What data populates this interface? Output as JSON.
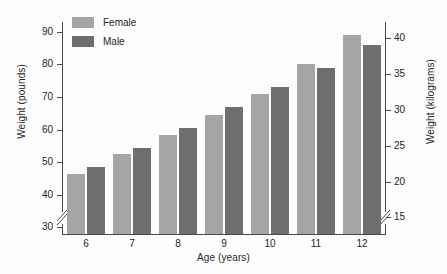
{
  "chart_data": {
    "type": "bar",
    "title": "",
    "subtitle": "",
    "xlabel": "Age (years)",
    "ylabel": "Weight (pounds)",
    "ylabel_secondary": "Weight (kilograms)",
    "categories": [
      "6",
      "7",
      "8",
      "9",
      "10",
      "11",
      "12"
    ],
    "series": [
      {
        "name": "Female",
        "color": "#a5a5a5",
        "values": [
          46.5,
          52.5,
          58.5,
          64.5,
          71,
          80,
          89
        ]
      },
      {
        "name": "Male",
        "color": "#6e6e6e",
        "values": [
          48.5,
          54.5,
          60.5,
          67,
          73,
          79,
          86
        ]
      }
    ],
    "ylim": [
      28,
      93
    ],
    "ylim_secondary": [
      12.7,
      42.2
    ],
    "yticks": [
      "90",
      "80",
      "70",
      "60",
      "50",
      "40",
      "30"
    ],
    "ytick_values": [
      90,
      80,
      70,
      60,
      50,
      40,
      30
    ],
    "yticks_secondary": [
      "40",
      "35",
      "30",
      "25",
      "20",
      "15"
    ],
    "ytick_values_secondary": [
      40,
      35,
      30,
      25,
      20,
      15
    ],
    "axis_break": true,
    "axis_break_note": "both vertical axes broken below lowest tick",
    "grid": false,
    "legend_position": "top-left",
    "legend": [
      "Female",
      "Male"
    ]
  },
  "legend": {
    "female_label": "Female",
    "male_label": "Male"
  },
  "axes": {
    "x_title": "Age (years)",
    "y_left_title": "Weight (pounds)",
    "y_right_title": "Weight (kilograms)"
  }
}
